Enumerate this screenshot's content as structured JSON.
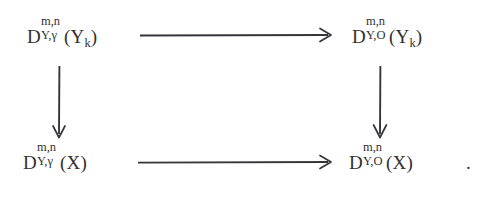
{
  "diagram": {
    "type": "commutative-diagram",
    "background_color": "#ffffff",
    "ink_color": "#333031",
    "nodes": [
      {
        "id": "top-left",
        "symbol": "D",
        "superscript": "m,n",
        "subscript": "Y,γ",
        "argument": "(Y",
        "argument_subscript": "k",
        "argument_close": ")",
        "plain": "D^{m,n}_{Y,γ}(Y_k)"
      },
      {
        "id": "top-right",
        "symbol": "D",
        "superscript": "m,n",
        "subscript": "Y,O",
        "argument": "(Y",
        "argument_subscript": "k",
        "argument_close": ")",
        "plain": "D^{m,n}_{Y,O}(Y_k)"
      },
      {
        "id": "bottom-left",
        "symbol": "D",
        "superscript": "m,n",
        "subscript": "Y,γ",
        "argument": "(X",
        "argument_subscript": "",
        "argument_close": ")",
        "plain": "D^{m,n}_{Y,γ}(X)"
      },
      {
        "id": "bottom-right",
        "symbol": "D",
        "superscript": "m,n",
        "subscript": "Y,O",
        "argument": "(X",
        "argument_subscript": "",
        "argument_close": ")",
        "plain": "D^{m,n}_{Y,O}(X)"
      }
    ],
    "arrows": [
      {
        "id": "top-horizontal",
        "direction": "right",
        "label": ""
      },
      {
        "id": "bottom-horizontal",
        "direction": "right",
        "label": ""
      },
      {
        "id": "left-vertical",
        "direction": "down",
        "label": ""
      },
      {
        "id": "right-vertical",
        "direction": "down",
        "label": ""
      }
    ],
    "punctuation": {
      "trailing": "."
    }
  }
}
